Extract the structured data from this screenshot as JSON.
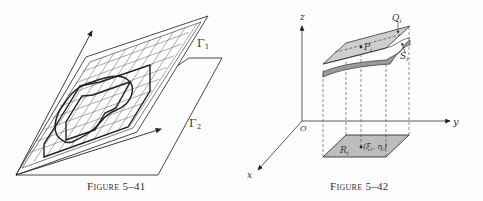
{
  "figures": [
    {
      "id": "fig-5-41",
      "caption": "Figure 5–41",
      "labels": {
        "plane1": "Γ",
        "plane1_sub": "1",
        "plane2": "Γ",
        "plane2_sub": "2"
      }
    },
    {
      "id": "fig-5-42",
      "caption": "Figure 5–42",
      "labels": {
        "z_axis": "z",
        "y_axis": "y",
        "x_axis": "x",
        "origin": "O",
        "Q": "Q",
        "Q_sub": "i",
        "P": "P",
        "P_sub": "i",
        "S": "S",
        "S_sub": "i",
        "R": "R",
        "R_sub": "i",
        "point": "(ξ",
        "point_sub1": "i",
        "point_mid": ", η",
        "point_sub2": "i",
        "point_end": ")"
      }
    }
  ],
  "colors": {
    "ink": "#333333",
    "grid": "#555555",
    "surface_fill": "#c8c8c8",
    "surface_under": "#9a9a9a",
    "base_fill": "#bdbdbd"
  }
}
